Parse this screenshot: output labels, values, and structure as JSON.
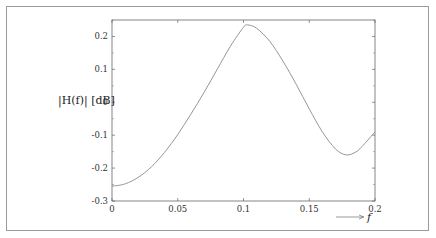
{
  "chart_data": {
    "type": "line",
    "title": "",
    "xlabel": "f",
    "ylabel": "|H(f)| [dB]",
    "xlim": [
      0,
      0.2
    ],
    "ylim": [
      -0.3,
      0.25
    ],
    "grid": false,
    "legend": null,
    "x_ticks": [
      0,
      0.05,
      0.1,
      0.15,
      0.2
    ],
    "x_tick_labels": [
      "0",
      "0.05",
      "0.1",
      "0.15",
      "0.2"
    ],
    "y_ticks": [
      -0.3,
      -0.2,
      -0.1,
      0,
      0.1,
      0.2
    ],
    "y_tick_labels": [
      "-0.3",
      "-0.2",
      "-0.1",
      "0",
      "0.1",
      "0.2"
    ],
    "series": [
      {
        "name": "|H(f)|",
        "color": "#8a8a8a",
        "x": [
          0,
          0.01,
          0.02,
          0.03,
          0.04,
          0.05,
          0.06,
          0.07,
          0.08,
          0.09,
          0.1,
          0.103,
          0.11,
          0.12,
          0.13,
          0.14,
          0.15,
          0.16,
          0.17,
          0.178,
          0.185,
          0.19,
          0.2
        ],
        "y": [
          -0.255,
          -0.248,
          -0.228,
          -0.196,
          -0.152,
          -0.098,
          -0.036,
          0.03,
          0.1,
          0.17,
          0.228,
          0.235,
          0.225,
          0.185,
          0.125,
          0.055,
          -0.02,
          -0.09,
          -0.142,
          -0.16,
          -0.152,
          -0.135,
          -0.09
        ]
      }
    ]
  }
}
